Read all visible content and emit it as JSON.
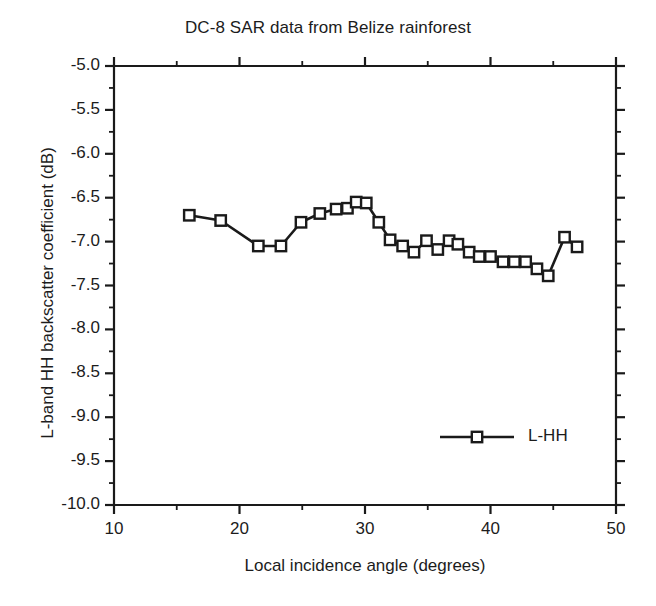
{
  "chart_data": {
    "type": "line",
    "title": "DC-8 SAR data from Belize rainforest",
    "xlabel": "Local incidence angle (degrees)",
    "ylabel": "L-band HH backscatter coefficient (dB)",
    "xlim": [
      10,
      50
    ],
    "ylim": [
      -10.0,
      -5.0
    ],
    "grid": false,
    "legend_position": "inside-lower-right",
    "x_major_ticks": [
      10,
      20,
      30,
      40,
      50
    ],
    "x_minor_tick_step": 5,
    "y_major_ticks": [
      -5.0,
      -5.5,
      -6.0,
      -6.5,
      -7.0,
      -7.5,
      -8.0,
      -8.5,
      -9.0,
      -9.5,
      -10.0
    ],
    "y_minor_tick_step": 0.25,
    "x_tick_labels": [
      "10",
      "20",
      "30",
      "40",
      "50"
    ],
    "y_tick_labels": [
      "-5.0",
      "-5.5",
      "-6.0",
      "-6.5",
      "-7.0",
      "-7.5",
      "-8.0",
      "-8.5",
      "-9.0",
      "-9.5",
      "-10.0"
    ],
    "marker": "open-square",
    "line_color": "#1a1a1a",
    "series": [
      {
        "name": "L-HH",
        "x": [
          16.0,
          18.5,
          21.5,
          23.3,
          24.9,
          26.4,
          27.7,
          28.6,
          29.3,
          30.1,
          31.1,
          32.0,
          33.0,
          33.9,
          34.9,
          35.8,
          36.7,
          37.4,
          38.3,
          39.1,
          40.0,
          41.0,
          41.9,
          42.8,
          43.7,
          44.6,
          45.9,
          46.9
        ],
        "y": [
          -6.7,
          -6.76,
          -7.05,
          -7.05,
          -6.78,
          -6.68,
          -6.63,
          -6.62,
          -6.55,
          -6.56,
          -6.78,
          -6.98,
          -7.05,
          -7.12,
          -6.99,
          -7.09,
          -6.99,
          -7.03,
          -7.12,
          -7.17,
          -7.17,
          -7.23,
          -7.23,
          -7.23,
          -7.31,
          -7.39,
          -6.95,
          -7.06
        ]
      }
    ]
  },
  "legend": {
    "entries": [
      {
        "label": "L-HH",
        "marker": "open-square"
      }
    ]
  }
}
